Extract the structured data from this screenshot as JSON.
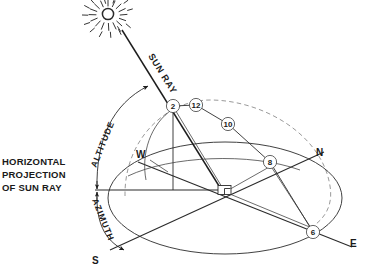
{
  "diagram": {
    "title_labels": {
      "horizontal_projection": [
        "HORIZONTAL",
        "PROJECTION",
        "OF SUN RAY"
      ],
      "altitude": "ALTITUDE",
      "azimuth": "AZIMUTH",
      "sun_ray": "SUN RAY"
    },
    "compass_points": [
      {
        "label": "W",
        "name": "west"
      },
      {
        "label": "N",
        "name": "north"
      },
      {
        "label": "E",
        "name": "east"
      },
      {
        "label": "S",
        "name": "south"
      }
    ],
    "hour_markers": [
      {
        "label": "2",
        "name": "hour-marker-2",
        "cx": 173,
        "cy": 106
      },
      {
        "label": "12",
        "name": "hour-marker-12",
        "cx": 196,
        "cy": 105
      },
      {
        "label": "10",
        "name": "hour-marker-10",
        "cx": 228,
        "cy": 124
      },
      {
        "label": "8",
        "name": "hour-marker-8",
        "cx": 270,
        "cy": 162
      },
      {
        "label": "6",
        "name": "hour-marker-6",
        "cx": 313,
        "cy": 232
      }
    ],
    "icons": {
      "sun": "sun-burst-icon"
    },
    "colors": {
      "line": "#2b2b2b",
      "dashed_arc": "#9a9a9a",
      "text": "#1a1a1a",
      "background": "#ffffff"
    },
    "geometry_notes": {
      "center_marker": "right-angle-square",
      "celestial_dome": "dashed semicircular arc",
      "horizon": "ellipse"
    }
  }
}
